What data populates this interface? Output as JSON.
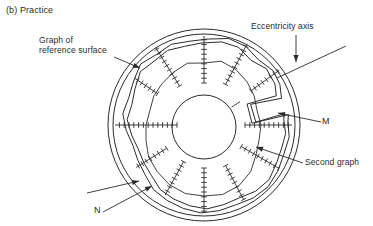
{
  "figure": {
    "caption": "(b) Practice",
    "labels": {
      "reference_line1": "Graph of",
      "reference_line2": "reference surface",
      "eccentricity": "Eccentricity axis",
      "m": "M",
      "n": "N",
      "second": "Second graph"
    },
    "colors": {
      "ink": "#2b2b2b",
      "background": "#ffffff"
    }
  },
  "diagram": {
    "center": {
      "x": 204,
      "y": 125
    },
    "outer_radii": [
      96,
      91
    ],
    "hole": {
      "x": 204,
      "y": 127,
      "r": 32
    },
    "eccentricity_axis": {
      "x1": 277,
      "y1": 78,
      "x2": 346,
      "y2": 46
    },
    "stub": {
      "angle": 33,
      "r0": 33,
      "r1": 43
    },
    "scales": [
      [
        0,
        41,
        88
      ],
      [
        36,
        58,
        93
      ],
      [
        62,
        46,
        92
      ],
      [
        90,
        42,
        89
      ],
      [
        122,
        46,
        91
      ],
      [
        146,
        56,
        84
      ],
      [
        180,
        27,
        89
      ],
      [
        212,
        44,
        80
      ],
      [
        241,
        42,
        80
      ],
      [
        270,
        43,
        88
      ],
      [
        298,
        46,
        85
      ],
      [
        330,
        43,
        87
      ]
    ],
    "traces": {
      "reference": [
        [
          28,
          86
        ],
        [
          38,
          88
        ],
        [
          50,
          85
        ],
        [
          62,
          89
        ],
        [
          74,
          90
        ],
        [
          88,
          86
        ],
        [
          100,
          85
        ],
        [
          112,
          87
        ],
        [
          124,
          85
        ],
        [
          136,
          88
        ],
        [
          148,
          83
        ],
        [
          160,
          80
        ],
        [
          172,
          82
        ],
        [
          184,
          78
        ],
        [
          196,
          74
        ],
        [
          208,
          75
        ],
        [
          220,
          77
        ],
        [
          232,
          82
        ],
        [
          244,
          84
        ],
        [
          256,
          86
        ],
        [
          268,
          88
        ],
        [
          280,
          87
        ],
        [
          292,
          86
        ],
        [
          304,
          88
        ],
        [
          316,
          89
        ],
        [
          328,
          87
        ],
        [
          340,
          85
        ],
        [
          352,
          86
        ],
        [
          2,
          84
        ],
        [
          7,
          85
        ],
        [
          3,
          52
        ],
        [
          24,
          51
        ],
        [
          19,
          82
        ]
      ],
      "reference_inner": [
        [
          30,
          82
        ],
        [
          42,
          84
        ],
        [
          54,
          80
        ],
        [
          66,
          85
        ],
        [
          78,
          85
        ],
        [
          92,
          82
        ],
        [
          104,
          81
        ],
        [
          116,
          83
        ],
        [
          128,
          81
        ],
        [
          140,
          83
        ],
        [
          152,
          78
        ],
        [
          164,
          75
        ],
        [
          176,
          77
        ],
        [
          188,
          73
        ],
        [
          200,
          70
        ],
        [
          212,
          71
        ],
        [
          224,
          73
        ],
        [
          236,
          78
        ],
        [
          248,
          80
        ],
        [
          260,
          82
        ],
        [
          272,
          84
        ],
        [
          284,
          82
        ],
        [
          296,
          81
        ],
        [
          308,
          84
        ],
        [
          320,
          85
        ],
        [
          332,
          82
        ],
        [
          344,
          81
        ],
        [
          354,
          82
        ],
        [
          4,
          80
        ],
        [
          8,
          81
        ],
        [
          2,
          48
        ],
        [
          26,
          48
        ],
        [
          22,
          78
        ]
      ],
      "second": [
        [
          0,
          57
        ],
        [
          15,
          55
        ],
        [
          30,
          58
        ],
        [
          45,
          61
        ],
        [
          60,
          64
        ],
        [
          75,
          66
        ],
        [
          90,
          62
        ],
        [
          105,
          64
        ],
        [
          120,
          61
        ],
        [
          135,
          59
        ],
        [
          150,
          58
        ],
        [
          165,
          56
        ],
        [
          180,
          58
        ],
        [
          195,
          60
        ],
        [
          210,
          64
        ],
        [
          225,
          66
        ],
        [
          240,
          69
        ],
        [
          255,
          71
        ],
        [
          270,
          71
        ],
        [
          285,
          72
        ],
        [
          300,
          70
        ],
        [
          315,
          66
        ],
        [
          330,
          60
        ],
        [
          345,
          57
        ]
      ]
    },
    "pointers": [
      {
        "name": "reference-graph-arrow",
        "x1": 114,
        "y1": 57,
        "x2": 140,
        "y2": 68
      },
      {
        "name": "eccentricity-axis-arrow",
        "x1": 296,
        "y1": 35,
        "x2": 296,
        "y2": 62
      },
      {
        "name": "m-arrow",
        "x1": 321,
        "y1": 122,
        "x2": 278,
        "y2": 113
      },
      {
        "name": "second-graph-arrow",
        "x1": 303,
        "y1": 163,
        "x2": 256,
        "y2": 147
      },
      {
        "name": "n-arrow",
        "x1": 103,
        "y1": 212,
        "x2": 152,
        "y2": 186
      },
      {
        "name": "aux-arrow",
        "x1": 87,
        "y1": 193,
        "x2": 139,
        "y2": 181
      }
    ]
  }
}
